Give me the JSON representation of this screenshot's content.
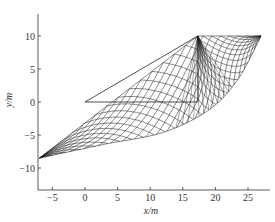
{
  "chart_data": {
    "type": "line",
    "title": "",
    "xlabel": "x/m",
    "ylabel": "y/m",
    "xlim": [
      -7,
      27.5
    ],
    "ylim": [
      -13,
      14
    ],
    "xticks": [
      -5,
      0,
      5,
      10,
      15,
      20,
      25
    ],
    "yticks": [
      -10,
      -5,
      0,
      5,
      10
    ],
    "xtick_labels": [
      "−5",
      "0",
      "5",
      "10",
      "15",
      "20",
      "25"
    ],
    "ytick_labels": [
      "−10",
      "−5",
      "0",
      "5",
      "10"
    ],
    "grid": false,
    "legend": null,
    "series": [
      {
        "name": "slope-face-triangle",
        "points": [
          [
            0,
            0
          ],
          [
            17.3,
            10
          ],
          [
            17.3,
            0
          ],
          [
            0,
            0
          ]
        ]
      },
      {
        "name": "slip-line-mesh",
        "description": "Slip-line field mesh: apex at (17.3, 10); left tip at (-7, -8.5); top edge y=10 from x=17.3 to x=27; lower curved boundary through approx (0, -6.8), (10, -5), (20, 0), (27, 10)"
      }
    ],
    "mesh": {
      "apex": [
        17.3,
        10
      ],
      "left_tip": [
        -7,
        -8.5
      ],
      "top_right": [
        27,
        10
      ],
      "n_lines": 16
    }
  },
  "axes": {
    "xlabel_text": "x/m",
    "ylabel_text": "y/m"
  }
}
